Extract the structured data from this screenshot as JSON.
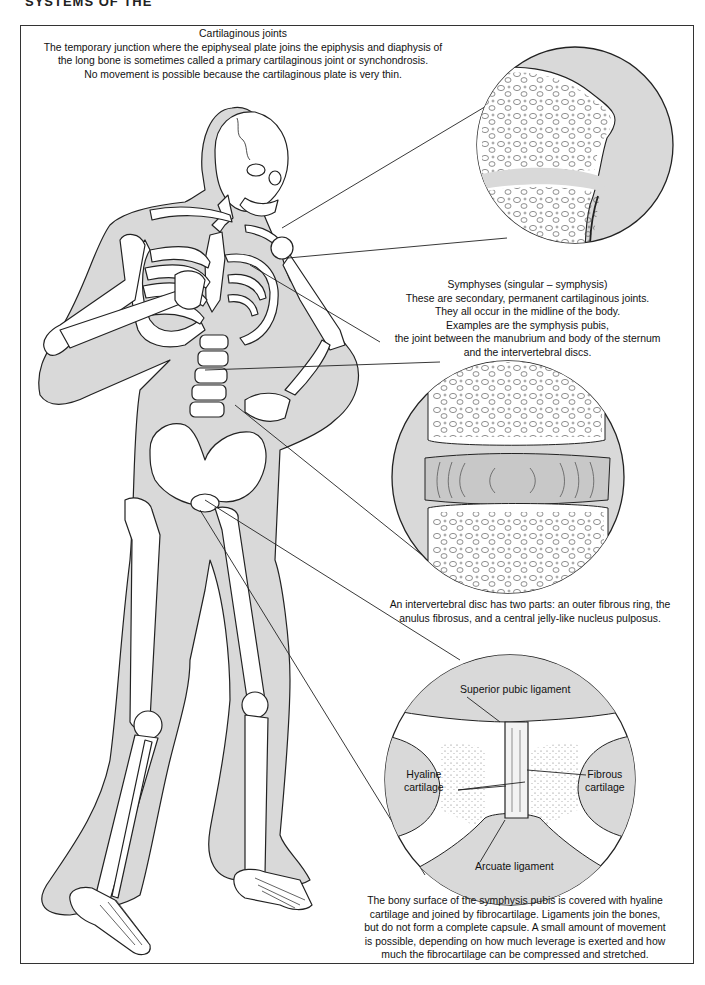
{
  "page": {
    "header": "SYSTEMS OF THE",
    "colors": {
      "background": "#ffffff",
      "body_fill": "#d9d9d9",
      "outline": "#222222",
      "disc_fill": "#c8c8c8"
    }
  },
  "captions": {
    "cartilaginous": {
      "title": "Cartilaginous joints",
      "lines": [
        "The temporary junction where the epiphyseal plate joins the  epiphysis and diaphysis of",
        "the long bone is sometimes called a primary cartilaginous joint or synchondrosis.",
        "No movement is possible because the cartilaginous plate is very thin."
      ]
    },
    "symphyses": {
      "title": "Symphyses  (singular – symphysis)",
      "lines": [
        "These are secondary, permanent cartilaginous joints.",
        "They all occur in the midline of the body.",
        "Examples are the symphysis pubis,",
        "the joint between the manubrium and body of the sternum",
        "and the intervertebral discs."
      ]
    },
    "intervertebral": {
      "lines": [
        "An intervertebral disc has two parts: an outer fibrous ring, the",
        "anulus fibrosus, and a central jelly-like nucleus pulposus."
      ]
    },
    "symphysis_pubis": {
      "lines": [
        "The bony surface of the symphysis pubis is covered  with hyaline",
        "cartilage and joined by fibrocartilage. Ligaments join the bones,",
        "but do not form a complete capsule. A small amount of movement",
        "is possible, depending on how much leverage is exerted and how",
        "much the fibrocartilage can be compressed and stretched."
      ]
    }
  },
  "detail_labels": {
    "superior_pubic_ligament": "Superior pubic ligament",
    "hyaline_cartilage": [
      "Hyaline",
      "cartilage"
    ],
    "fibrous_cartilage": [
      "Fibrous",
      "cartilage"
    ],
    "arcuate_ligament": "Arcuate ligament"
  },
  "figures": {
    "main": "skeleton-figure",
    "details": [
      "epiphyseal-plate-detail",
      "intervertebral-disc-detail",
      "symphysis-pubis-detail"
    ]
  }
}
